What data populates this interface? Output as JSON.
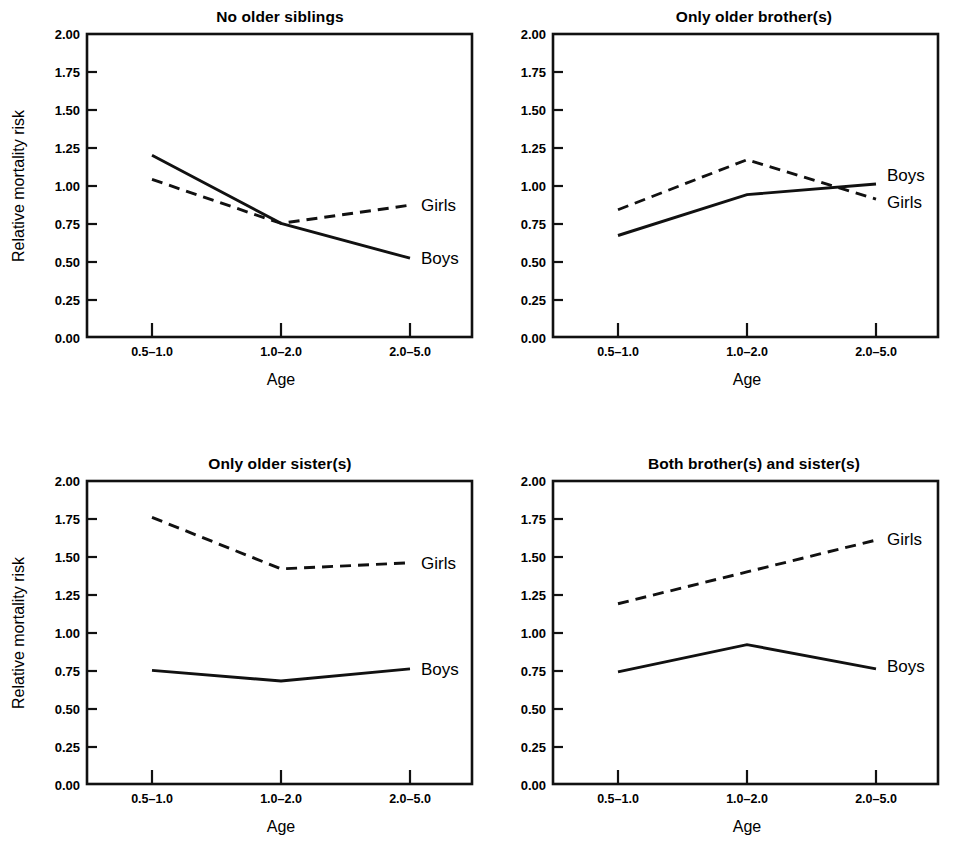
{
  "figure": {
    "axis_title_x": "Age",
    "axis_title_y": "Relative mortality risk",
    "ytick_labels": [
      "2.00",
      "1.75",
      "1.50",
      "1.25",
      "1.00",
      "0.75",
      "0.50",
      "0.25",
      "0.00"
    ],
    "xtick_labels": [
      "0.5–1.0",
      "1.0–2.0",
      "2.0–5.0"
    ],
    "line_color": "#111111",
    "background_color": "#ffffff"
  },
  "chart_data": [
    {
      "type": "line",
      "title": "No older siblings",
      "xlabel": "Age",
      "ylabel": "Relative mortality risk",
      "categories": [
        "0.5–1.0",
        "1.0–2.0",
        "2.0–5.0"
      ],
      "ylim": [
        0.0,
        2.0
      ],
      "yticks": [
        0.0,
        0.25,
        0.5,
        0.75,
        1.0,
        1.25,
        1.5,
        1.75,
        2.0
      ],
      "grid": false,
      "legend_position": "right-of-axes (inline end-of-line labels)",
      "series": [
        {
          "name": "Boys",
          "style": "solid",
          "values": [
            1.2,
            0.75,
            0.52
          ],
          "label_y": 0.52
        },
        {
          "name": "Girls",
          "style": "dashed",
          "values": [
            1.04,
            0.75,
            0.87
          ],
          "label_y": 0.87
        }
      ]
    },
    {
      "type": "line",
      "title": "Only older brother(s)",
      "xlabel": "Age",
      "ylabel": "Relative mortality risk",
      "categories": [
        "0.5–1.0",
        "1.0–2.0",
        "2.0–5.0"
      ],
      "ylim": [
        0.0,
        2.0
      ],
      "yticks": [
        0.0,
        0.25,
        0.5,
        0.75,
        1.0,
        1.25,
        1.5,
        1.75,
        2.0
      ],
      "grid": false,
      "legend_position": "right-of-axes (inline end-of-line labels)",
      "series": [
        {
          "name": "Boys",
          "style": "solid",
          "values": [
            0.67,
            0.94,
            1.01
          ],
          "label_y": 1.07
        },
        {
          "name": "Girls",
          "style": "dashed",
          "values": [
            0.84,
            1.17,
            0.91
          ],
          "label_y": 0.89
        }
      ]
    },
    {
      "type": "line",
      "title": "Only older sister(s)",
      "xlabel": "Age",
      "ylabel": "Relative mortality risk",
      "categories": [
        "0.5–1.0",
        "1.0–2.0",
        "2.0–5.0"
      ],
      "ylim": [
        0.0,
        2.0
      ],
      "yticks": [
        0.0,
        0.25,
        0.5,
        0.75,
        1.0,
        1.25,
        1.5,
        1.75,
        2.0
      ],
      "grid": false,
      "legend_position": "right-of-axes (inline end-of-line labels)",
      "series": [
        {
          "name": "Boys",
          "style": "solid",
          "values": [
            0.75,
            0.68,
            0.76
          ],
          "label_y": 0.76
        },
        {
          "name": "Girls",
          "style": "dashed",
          "values": [
            1.76,
            1.42,
            1.46
          ],
          "label_y": 1.46
        }
      ]
    },
    {
      "type": "line",
      "title": "Both brother(s) and sister(s)",
      "xlabel": "Age",
      "ylabel": "Relative mortality risk",
      "categories": [
        "0.5–1.0",
        "1.0–2.0",
        "2.0–5.0"
      ],
      "ylim": [
        0.0,
        2.0
      ],
      "yticks": [
        0.0,
        0.25,
        0.5,
        0.75,
        1.0,
        1.25,
        1.5,
        1.75,
        2.0
      ],
      "grid": false,
      "legend_position": "right-of-axes (inline end-of-line labels)",
      "series": [
        {
          "name": "Boys",
          "style": "solid",
          "values": [
            0.74,
            0.92,
            0.76
          ],
          "label_y": 0.78
        },
        {
          "name": "Girls",
          "style": "dashed",
          "values": [
            1.19,
            1.4,
            1.61
          ],
          "label_y": 1.62
        }
      ]
    }
  ]
}
